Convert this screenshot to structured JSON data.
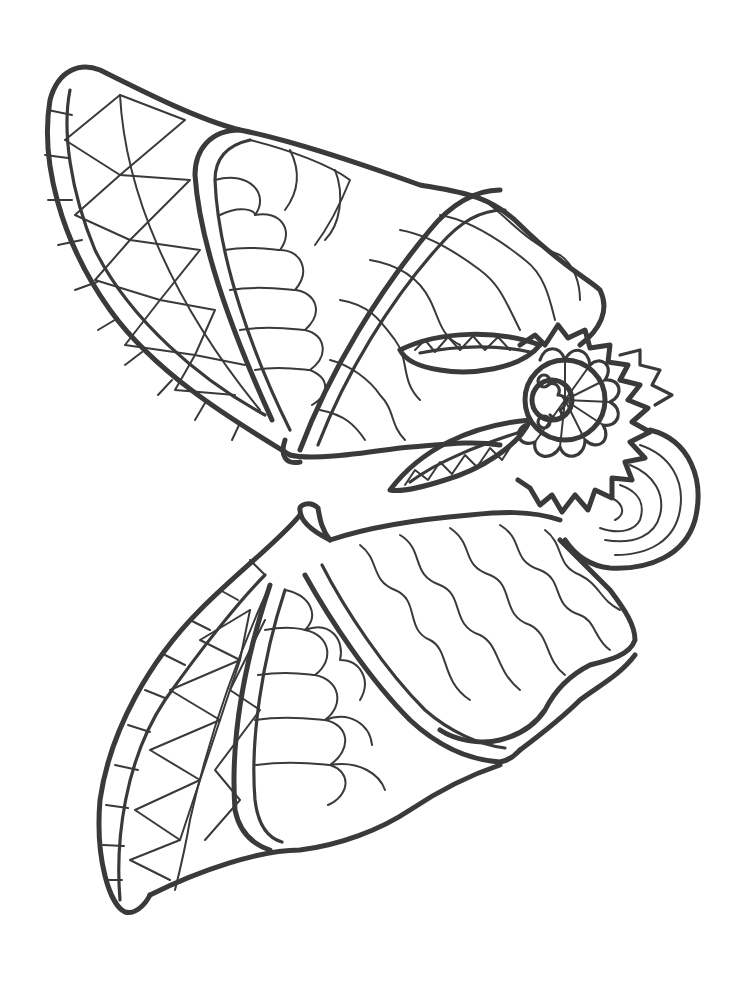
{
  "image": {
    "title": "",
    "subject": "bat-coloring-page",
    "orientation": "rotated-90",
    "colors": {
      "background": "#ffffff",
      "line": "#3a3a3a"
    },
    "parts": [
      {
        "name": "upper-wing",
        "pattern": "triangles-and-scales"
      },
      {
        "name": "lower-wing",
        "pattern": "triangles-and-scales"
      },
      {
        "name": "body",
        "pattern": "wavy-lines"
      },
      {
        "name": "ears",
        "pattern": "triangle-band"
      },
      {
        "name": "face",
        "pattern": "flower-petals"
      },
      {
        "name": "mane",
        "pattern": "zigzag"
      },
      {
        "name": "head-back",
        "pattern": "arcs"
      }
    ]
  }
}
